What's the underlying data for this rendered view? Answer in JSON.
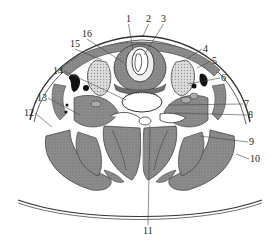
{
  "figure": {
    "type": "anatomical cross-section",
    "colors": {
      "muscle": "#8a8a8a",
      "muscle_dark": "#6e6e6e",
      "gland": "#cfcfcf",
      "outline": "#333333",
      "leader": "#444444",
      "background": "#ffffff"
    },
    "labels": [
      {
        "num": "1",
        "x": 126,
        "y": 14,
        "lx": 133,
        "ly": 50
      },
      {
        "num": "2",
        "x": 146,
        "y": 14,
        "lx": 143,
        "ly": 36
      },
      {
        "num": "3",
        "x": 161,
        "y": 14,
        "lx": 144,
        "ly": 55
      },
      {
        "num": "4",
        "x": 203,
        "y": 44,
        "lx": 188,
        "ly": 58
      },
      {
        "num": "5",
        "x": 212,
        "y": 56,
        "lx": 197,
        "ly": 68
      },
      {
        "num": "6",
        "x": 221,
        "y": 73,
        "lx": 188,
        "ly": 84
      },
      {
        "num": "7",
        "x": 244,
        "y": 99,
        "lx": 168,
        "ly": 105
      },
      {
        "num": "8",
        "x": 248,
        "y": 110,
        "lx": 175,
        "ly": 113
      },
      {
        "num": "9",
        "x": 249,
        "y": 137,
        "lx": 200,
        "ly": 136
      },
      {
        "num": "10",
        "x": 250,
        "y": 154,
        "lx": 236,
        "ly": 154
      },
      {
        "num": "11",
        "x": 143,
        "y": 226,
        "lx": 150,
        "ly": 125
      },
      {
        "num": "12",
        "x": 24,
        "y": 108,
        "lx": 52,
        "ly": 127
      },
      {
        "num": "13",
        "x": 37,
        "y": 93,
        "lx": 80,
        "ly": 115
      },
      {
        "num": "14",
        "x": 53,
        "y": 66,
        "lx": 126,
        "ly": 100
      },
      {
        "num": "15",
        "x": 70,
        "y": 39,
        "lx": 102,
        "ly": 60
      },
      {
        "num": "16",
        "x": 82,
        "y": 29,
        "lx": 124,
        "ly": 63
      }
    ]
  }
}
